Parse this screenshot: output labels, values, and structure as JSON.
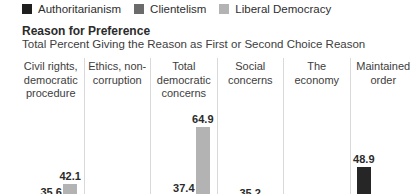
{
  "legend": {
    "items": [
      {
        "label": "Authoritarianism",
        "color": "#1f1f1f"
      },
      {
        "label": "Clientelism",
        "color": "#6b6b6b"
      },
      {
        "label": "Liberal Democracy",
        "color": "#b3b3b3"
      }
    ]
  },
  "header": {
    "title": "Reason for Preference",
    "subtitle": "Total Percent Giving the Reason as First or Second Choice Reason"
  },
  "chart_data": {
    "type": "bar",
    "title": "Reason for Preference",
    "subtitle": "Total Percent Giving the Reason as First or Second Choice Reason",
    "unit": "percent",
    "categories": [
      "Civil rights,\ndemocratic\nprocedure",
      "Ethics, non-\ncorruption",
      "Total\ndemocratic\nconcerns",
      "Social\nconcerns",
      "The\neconomy",
      "Maintained\norder"
    ],
    "series": [
      {
        "name": "Authoritarianism",
        "color": "#262626",
        "values": [
          null,
          null,
          null,
          null,
          null,
          48.9
        ]
      },
      {
        "name": "Clientelism",
        "color": "#6b6b6b",
        "values": [
          35.6,
          null,
          37.4,
          35.2,
          null,
          null
        ]
      },
      {
        "name": "Liberal Democracy",
        "color": "#b3b3b3",
        "values": [
          42.1,
          null,
          64.9,
          null,
          null,
          null
        ]
      }
    ],
    "visible_value_labels": [
      "42.1",
      "64.9",
      "37.4",
      "48.9"
    ],
    "legend_position": "top",
    "grid": false,
    "baseline_cropped_below_view": true
  }
}
